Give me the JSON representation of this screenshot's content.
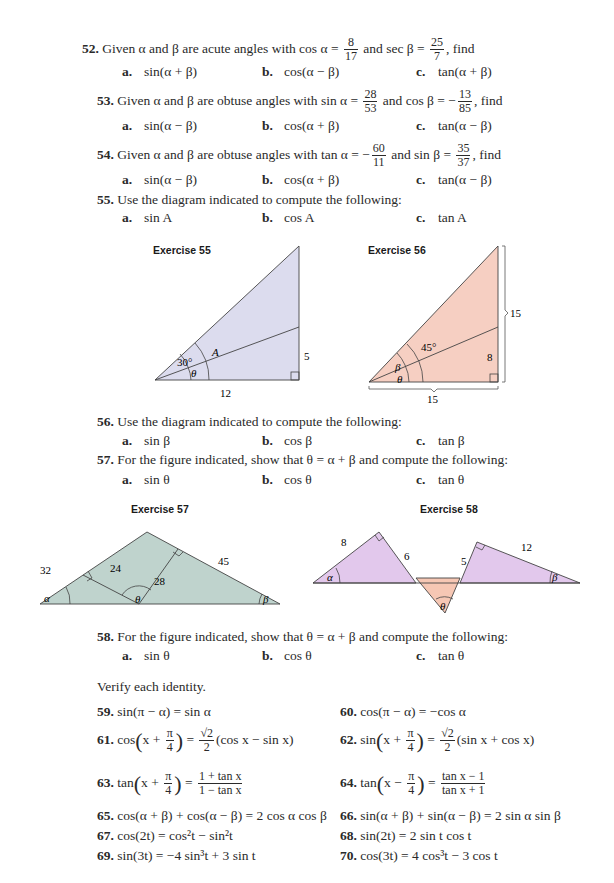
{
  "exercises": {
    "e52": {
      "num": "52.",
      "text_pre": "Given α and β are acute angles with cos α =",
      "frac1": {
        "n": "8",
        "d": "17"
      },
      "mid": "and sec β =",
      "frac2": {
        "n": "25",
        "d": "7"
      },
      "post": ", find",
      "parts": [
        {
          "label": "a.",
          "expr": "sin(α + β)"
        },
        {
          "label": "b.",
          "expr": "cos(α − β)"
        },
        {
          "label": "c.",
          "expr": "tan(α + β)"
        }
      ]
    },
    "e53": {
      "num": "53.",
      "text_pre": "Given α and β are obtuse angles with sin α =",
      "frac1": {
        "n": "28",
        "d": "53"
      },
      "mid": "and cos β = −",
      "frac2": {
        "n": "13",
        "d": "85"
      },
      "post": ", find",
      "parts": [
        {
          "label": "a.",
          "expr": "sin(α − β)"
        },
        {
          "label": "b.",
          "expr": "cos(α + β)"
        },
        {
          "label": "c.",
          "expr": "tan(α − β)"
        }
      ]
    },
    "e54": {
      "num": "54.",
      "text_pre": "Given α and β are obtuse angles with tan α = −",
      "frac1": {
        "n": "60",
        "d": "11"
      },
      "mid": "and sin β =",
      "frac2": {
        "n": "35",
        "d": "37"
      },
      "post": ", find",
      "parts": [
        {
          "label": "a.",
          "expr": "sin(α − β)"
        },
        {
          "label": "b.",
          "expr": "cos(α + β)"
        },
        {
          "label": "c.",
          "expr": "tan(α − β)"
        }
      ]
    },
    "e55": {
      "num": "55.",
      "text": "Use the diagram indicated to compute the following:",
      "parts": [
        {
          "label": "a.",
          "expr": "sin A"
        },
        {
          "label": "b.",
          "expr": "cos A"
        },
        {
          "label": "c.",
          "expr": "tan A"
        }
      ]
    },
    "e56": {
      "num": "56.",
      "text": "Use the diagram indicated to compute the following:",
      "parts": [
        {
          "label": "a.",
          "expr": "sin β"
        },
        {
          "label": "b.",
          "expr": "cos β"
        },
        {
          "label": "c.",
          "expr": "tan β"
        }
      ]
    },
    "e57": {
      "num": "57.",
      "text": "For the figure indicated, show that θ = α + β and compute the following:",
      "parts": [
        {
          "label": "a.",
          "expr": "sin θ"
        },
        {
          "label": "b.",
          "expr": "cos θ"
        },
        {
          "label": "c.",
          "expr": "tan θ"
        }
      ]
    },
    "e58": {
      "num": "58.",
      "text": "For the figure indicated, show that θ = α + β and compute the following:",
      "parts": [
        {
          "label": "a.",
          "expr": "sin θ"
        },
        {
          "label": "b.",
          "expr": "cos θ"
        },
        {
          "label": "c.",
          "expr": "tan θ"
        }
      ]
    }
  },
  "figures": {
    "f55": {
      "title": "Exercise 55",
      "angle_30": "30°",
      "angle_A": "A",
      "angle_theta": "θ",
      "side_12": "12",
      "side_5": "5",
      "fill": "#dcdcee"
    },
    "f56": {
      "title": "Exercise 56",
      "angle_45": "45°",
      "angle_beta": "β",
      "angle_theta": "θ",
      "side_8": "8",
      "side_15_right": "15",
      "side_15_bottom": "15",
      "fill": "#f6cfc2"
    },
    "f57": {
      "title": "Exercise 57",
      "side_32": "32",
      "side_24": "24",
      "side_28": "28",
      "side_45": "45",
      "angle_alpha": "α",
      "angle_theta": "θ",
      "angle_beta": "β",
      "fill": "#bfd3cd"
    },
    "f58": {
      "title": "Exercise 58",
      "side_8": "8",
      "side_6": "6",
      "side_5": "5",
      "side_12": "12",
      "angle_alpha": "α",
      "angle_beta": "β",
      "angle_theta": "θ",
      "fill_tri": "#e2c8ec",
      "fill_theta": "#f6c7b4"
    }
  },
  "verify": {
    "heading": "Verify each identity.",
    "items": [
      {
        "num": "59.",
        "expr": "sin(π − α) = sin α"
      },
      {
        "num": "60.",
        "expr": "cos(π − α) = −cos α"
      },
      {
        "num": "61.",
        "pre": "cos",
        "inner": "x +",
        "pi": "π",
        "four": "4",
        "eq": "=",
        "rt": "√2",
        "two": "2",
        "post": "(cos x − sin x)"
      },
      {
        "num": "62.",
        "pre": "sin",
        "inner": "x +",
        "pi": "π",
        "four": "4",
        "eq": "=",
        "rt": "√2",
        "two": "2",
        "post": "(sin x + cos x)"
      },
      {
        "num": "63.",
        "pre": "tan",
        "inner": "x +",
        "pi": "π",
        "four": "4",
        "eq": "=",
        "fn": "1 + tan x",
        "fd": "1 − tan x"
      },
      {
        "num": "64.",
        "pre": "tan",
        "inner": "x −",
        "pi": "π",
        "four": "4",
        "eq": "=",
        "fn": "tan x − 1",
        "fd": "tan x + 1"
      },
      {
        "num": "65.",
        "expr": "cos(α + β) + cos(α − β) = 2 cos α cos β"
      },
      {
        "num": "66.",
        "expr": "sin(α + β) + sin(α − β) = 2 sin α sin β"
      },
      {
        "num": "67.",
        "expr": "cos(2t) = cos²t − sin²t"
      },
      {
        "num": "68.",
        "expr": "sin(2t) = 2 sin t cos t"
      },
      {
        "num": "69.",
        "expr": "sin(3t) = −4 sin³t + 3 sin t"
      },
      {
        "num": "70.",
        "expr": "cos(3t) = 4 cos³t − 3 cos t"
      }
    ]
  }
}
